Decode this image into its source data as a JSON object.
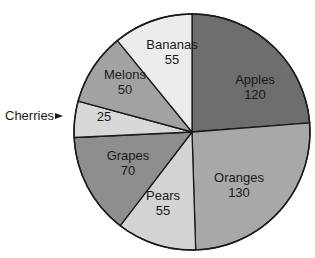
{
  "chart_data": {
    "type": "pie",
    "title": "",
    "start_angle_deg": 0,
    "direction": "clockwise",
    "categories": [
      "Apples",
      "Oranges",
      "Pears",
      "Grapes",
      "Cherries",
      "Melons",
      "Bananas"
    ],
    "values": [
      120,
      130,
      55,
      70,
      25,
      50,
      55
    ],
    "total": 505,
    "colors": [
      "#6e6e6e",
      "#a8a8a8",
      "#d3d3d3",
      "#8e8e8e",
      "#d8d8d8",
      "#a2a2a2",
      "#ececec"
    ],
    "labels": [
      {
        "name": "Apples",
        "value": "120",
        "x": 255,
        "y": 84
      },
      {
        "name": "Oranges",
        "value": "130",
        "x": 239,
        "y": 182
      },
      {
        "name": "Pears",
        "value": "55",
        "x": 163,
        "y": 200
      },
      {
        "name": "Grapes",
        "value": "70",
        "x": 128,
        "y": 160
      },
      {
        "name": "Cherries",
        "value": "25",
        "x": 104,
        "y": 121,
        "callout": true
      },
      {
        "name": "Melons",
        "value": "50",
        "x": 125,
        "y": 79
      },
      {
        "name": "Bananas",
        "value": "55",
        "x": 172,
        "y": 49
      }
    ],
    "callout": {
      "text": "Cherries",
      "x": 5,
      "y": 120,
      "arrow_x": 63,
      "arrow_y": 116
    },
    "geometry": {
      "cx": 192,
      "cy": 132,
      "r": 118
    },
    "legend": "none"
  }
}
